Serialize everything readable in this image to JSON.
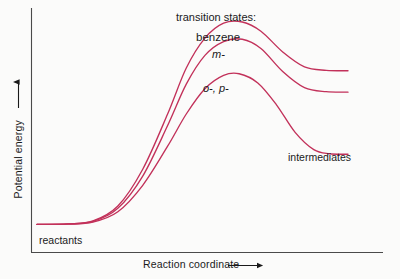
{
  "figure": {
    "background_color": "#fbfbfa",
    "curve_color": "#c2315a",
    "axis_color": "#4a4a4a",
    "text_color": "#1a1a1a"
  },
  "axes": {
    "y_label": "Potential energy",
    "y_axis_arrow": "up-arrow-icon",
    "x_label": "Reaction coordinate",
    "x_axis_arrow": "right-arrow-icon"
  },
  "annotations": {
    "group_title": "transition states:",
    "benzene": "benzene",
    "meta": "m-",
    "ortho_para": "o-, p-",
    "intermediates": "intermediates",
    "reactants": "reactants"
  },
  "chart_data": {
    "type": "line",
    "title": "transition states:",
    "xlabel": "Reaction coordinate",
    "ylabel": "Potential energy",
    "grid": false,
    "legend": "inline-annotations",
    "axis_ticks": false,
    "xlim": [
      0,
      1
    ],
    "ylim": [
      0,
      1
    ],
    "note": "Reaction energy profile for electrophilic aromatic substitution: three reaction coordinates sharing a common reactant level, each rising to a transition-state maximum and falling to an intermediate plateau.",
    "series": [
      {
        "name": "benzene",
        "color": "#c2315a",
        "label": "benzene",
        "transition_state_energy": 1.0,
        "intermediate_energy": 0.79,
        "points": [
          {
            "x": 0.0,
            "y": 0.12
          },
          {
            "x": 0.1,
            "y": 0.122
          },
          {
            "x": 0.18,
            "y": 0.135
          },
          {
            "x": 0.26,
            "y": 0.2
          },
          {
            "x": 0.34,
            "y": 0.36
          },
          {
            "x": 0.42,
            "y": 0.6
          },
          {
            "x": 0.48,
            "y": 0.8
          },
          {
            "x": 0.54,
            "y": 0.93
          },
          {
            "x": 0.6,
            "y": 0.995
          },
          {
            "x": 0.66,
            "y": 1.0
          },
          {
            "x": 0.72,
            "y": 0.96
          },
          {
            "x": 0.79,
            "y": 0.87
          },
          {
            "x": 0.86,
            "y": 0.805
          },
          {
            "x": 0.93,
            "y": 0.79
          },
          {
            "x": 1.0,
            "y": 0.788
          }
        ]
      },
      {
        "name": "meta",
        "color": "#c2315a",
        "label": "m-",
        "transition_state_energy": 0.925,
        "intermediate_energy": 0.695,
        "points": [
          {
            "x": 0.0,
            "y": 0.12
          },
          {
            "x": 0.1,
            "y": 0.122
          },
          {
            "x": 0.18,
            "y": 0.133
          },
          {
            "x": 0.26,
            "y": 0.19
          },
          {
            "x": 0.34,
            "y": 0.33
          },
          {
            "x": 0.42,
            "y": 0.55
          },
          {
            "x": 0.48,
            "y": 0.73
          },
          {
            "x": 0.54,
            "y": 0.855
          },
          {
            "x": 0.6,
            "y": 0.915
          },
          {
            "x": 0.66,
            "y": 0.925
          },
          {
            "x": 0.72,
            "y": 0.885
          },
          {
            "x": 0.79,
            "y": 0.785
          },
          {
            "x": 0.86,
            "y": 0.715
          },
          {
            "x": 0.93,
            "y": 0.697
          },
          {
            "x": 1.0,
            "y": 0.695
          }
        ]
      },
      {
        "name": "ortho-para",
        "color": "#c2315a",
        "label": "o-, p-",
        "transition_state_energy": 0.775,
        "intermediate_energy": 0.425,
        "points": [
          {
            "x": 0.0,
            "y": 0.12
          },
          {
            "x": 0.1,
            "y": 0.121
          },
          {
            "x": 0.18,
            "y": 0.13
          },
          {
            "x": 0.26,
            "y": 0.175
          },
          {
            "x": 0.34,
            "y": 0.29
          },
          {
            "x": 0.42,
            "y": 0.46
          },
          {
            "x": 0.48,
            "y": 0.6
          },
          {
            "x": 0.54,
            "y": 0.71
          },
          {
            "x": 0.6,
            "y": 0.768
          },
          {
            "x": 0.65,
            "y": 0.775
          },
          {
            "x": 0.71,
            "y": 0.735
          },
          {
            "x": 0.77,
            "y": 0.64
          },
          {
            "x": 0.83,
            "y": 0.52
          },
          {
            "x": 0.89,
            "y": 0.445
          },
          {
            "x": 0.94,
            "y": 0.427
          },
          {
            "x": 1.0,
            "y": 0.425
          }
        ]
      }
    ]
  }
}
